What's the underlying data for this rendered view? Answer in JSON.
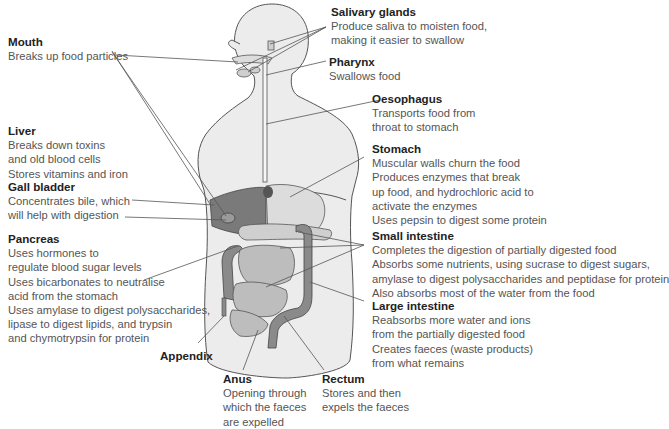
{
  "diagram": {
    "type": "labelled anatomical diagram",
    "colors": {
      "body_fill": "#ececec",
      "body_outline": "#555555",
      "organ_dark": "#7a7a7a",
      "organ_mid": "#bdbdbd",
      "organ_light": "#dcdcdc",
      "leader_line": "#555555"
    }
  },
  "labels": {
    "mouth": {
      "title": "Mouth",
      "desc": "Breaks up food particles"
    },
    "liver": {
      "title": "Liver",
      "desc": "Breaks down toxins\nand old blood cells\nStores vitamins and iron"
    },
    "gall_bladder": {
      "title": "Gall bladder",
      "desc": "Concentrates bile, which\nwill help with digestion"
    },
    "pancreas": {
      "title": "Pancreas",
      "desc": "Uses hormones to\nregulate blood sugar levels\nUses bicarbonates to neutralise\nacid from the stomach\nUses amylase to digest polysaccharides,\nlipase to digest lipids, and trypsin\nand chymotrypsin for protein"
    },
    "appendix": {
      "title": "Appendix"
    },
    "anus": {
      "title": "Anus",
      "desc": "Opening through\nwhich the faeces\nare expelled"
    },
    "rectum": {
      "title": "Rectum",
      "desc": "Stores and then\nexpels the faeces"
    },
    "salivary_glands": {
      "title": "Salivary glands",
      "desc": "Produce saliva to moisten food,\nmaking it easier to swallow"
    },
    "pharynx": {
      "title": "Pharynx",
      "desc": "Swallows food"
    },
    "oesophagus": {
      "title": "Oesophagus",
      "desc": "Transports food from\nthroat to stomach"
    },
    "stomach": {
      "title": "Stomach",
      "desc": "Muscular walls churn the food\nProduces enzymes that break\nup food, and hydrochloric acid to\nactivate the enzymes\nUses pepsin to digest some protein"
    },
    "small_intestine": {
      "title": "Small intestine",
      "desc": "Completes the digestion of partially digested food\nAbsorbs some nutrients, using sucrase to digest sugars,\namylase to digest polysaccharides and peptidase for protein\nAlso absorbs most of the water from the food"
    },
    "large_intestine": {
      "title": "Large intestine",
      "desc": "Reabsorbs more water and ions\nfrom the partially digested food\nCreates faeces (waste products)\nfrom what remains"
    }
  }
}
